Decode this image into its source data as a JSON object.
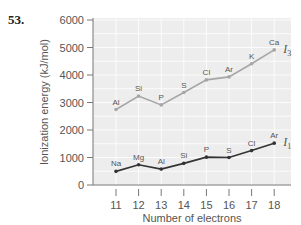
{
  "question_number": "53.",
  "chart_data": {
    "type": "line",
    "title": "",
    "xlabel": "Number of electrons",
    "ylabel": "Ionization energy (kJ/mol)",
    "x": [
      11,
      12,
      13,
      14,
      15,
      16,
      17,
      18
    ],
    "x_tick_labels": [
      "11",
      "12",
      "13",
      "14",
      "15",
      "16",
      "17",
      "18"
    ],
    "y_tick_labels": [
      "0",
      "1000",
      "2000",
      "3000",
      "4000",
      "5000",
      "6000"
    ],
    "ylim": [
      0,
      6000
    ],
    "grid": true,
    "legend": "inline labels at line ends",
    "series": [
      {
        "name": "I3",
        "label_main": "I",
        "label_sub": "3",
        "color": "#a6a6a6",
        "point_labels": [
          "Al",
          "Si",
          "P",
          "S",
          "Cl",
          "Ar",
          "K",
          "Ca"
        ],
        "values": [
          2745,
          3232,
          2912,
          3361,
          3822,
          3931,
          4411,
          4912
        ]
      },
      {
        "name": "I1",
        "label_main": "I",
        "label_sub": "1",
        "color": "#333333",
        "point_labels": [
          "Na",
          "Mg",
          "Al",
          "Si",
          "P",
          "S",
          "Cl",
          "Ar"
        ],
        "values": [
          496,
          738,
          578,
          787,
          1012,
          1000,
          1251,
          1521
        ]
      }
    ]
  },
  "colors": {
    "plot_background": "#ededed",
    "grid": "#ffffff",
    "axis": "#777777"
  }
}
